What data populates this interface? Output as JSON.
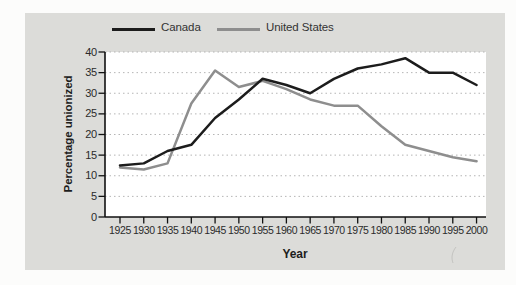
{
  "figure": {
    "background_color": "#dcdcd9",
    "plot_background": "#ffffff",
    "axis_color": "#111111",
    "grid_color": "#b5b5b5",
    "text_color": "#2b2b2b"
  },
  "chart_data": {
    "type": "line",
    "title": "",
    "xlabel": "Year",
    "ylabel": "Percentage unionized",
    "categories": [
      "1925",
      "1930",
      "1935",
      "1940",
      "1945",
      "1950",
      "1955",
      "1960",
      "1965",
      "1970",
      "1975",
      "1980",
      "1985",
      "1990",
      "1995",
      "2000"
    ],
    "series": [
      {
        "name": "Canada",
        "color": "#1c1c1c",
        "values": [
          12.5,
          13,
          16,
          17.5,
          24,
          28.5,
          33.5,
          32,
          30,
          33.5,
          36,
          37,
          38.5,
          35,
          35,
          32
        ]
      },
      {
        "name": "United States",
        "color": "#8e8e8e",
        "values": [
          12,
          11.5,
          13,
          27.5,
          35.5,
          31.5,
          33,
          31,
          28.5,
          27,
          27,
          22,
          17.5,
          16,
          14.5,
          13.5
        ]
      }
    ],
    "ylim": [
      0,
      40
    ],
    "yticks": [
      0,
      5,
      10,
      15,
      20,
      25,
      30,
      35,
      40
    ],
    "grid": "horizontal-dotted",
    "legend_position": "top-center"
  }
}
